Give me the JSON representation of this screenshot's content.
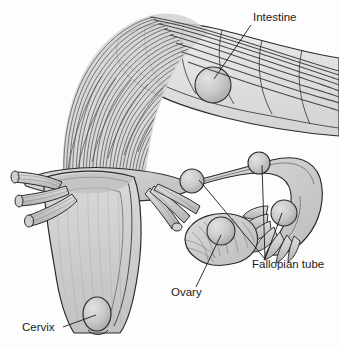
{
  "figure": {
    "background_color": "#fdfdfd",
    "line_color": "#2b2b2b",
    "organ_fill": "#c9c9c9",
    "organ_fill_light": "#dcdcdc",
    "organ_fill_dark": "#b4b4b4",
    "nodule_fill": "#c4c4c4",
    "adhesion_color": "#4a4a4a"
  },
  "labels": [
    {
      "id": "intestine",
      "text": "Intestine",
      "text_x": 253,
      "text_y": 21,
      "anchor": "start",
      "leader": "M251,25 L214,79"
    },
    {
      "id": "fallopian-tube",
      "text": "Fallopian tube",
      "text_x": 252,
      "text_y": 268,
      "anchor": "start",
      "leader": "M265,259 L199,180 M265,259 L262,165 M265,259 L282,213"
    },
    {
      "id": "ovary",
      "text": "Ovary",
      "text_x": 171,
      "text_y": 296,
      "anchor": "start",
      "leader": "M196,287 L221,235"
    },
    {
      "id": "cervix",
      "text": "Cervix",
      "text_x": 22,
      "text_y": 331,
      "anchor": "start",
      "leader": "M63,327 L96,315"
    }
  ],
  "structures": {
    "intestine": {
      "name": "intestine",
      "description": "Haustrated loop of large bowel across upper right",
      "implant_count": 1
    },
    "adhesion_band": {
      "name": "fibrous-adhesion-band",
      "description": "Dense curtain of fibrous strands arching from intestine down to uterine fundus",
      "strand_count": 34
    },
    "uterus": {
      "name": "uterus",
      "description": "Pear shaped uterine body with broad ligament wings and cavity outline"
    },
    "cervix": {
      "name": "cervix",
      "description": "Oval cervical opening at inferior uterus",
      "implant_count": 1
    },
    "left_vessels": {
      "name": "left-cut-vessels",
      "description": "Three cut tubular vessel ends projecting to the left",
      "count": 3
    },
    "right_vessels": {
      "name": "right-cut-vessels",
      "description": "Three cut tubular vessel ends projecting down-right",
      "count": 3
    },
    "fallopian_tube": {
      "name": "fallopian-tube",
      "description": "Right fallopian tube arching laterally ending in fimbriae",
      "implant_count": 3,
      "fimbria_count": 7
    },
    "ovary": {
      "name": "ovary",
      "description": "Lobulated right ovary with surface striations",
      "implant_count": 1
    }
  }
}
